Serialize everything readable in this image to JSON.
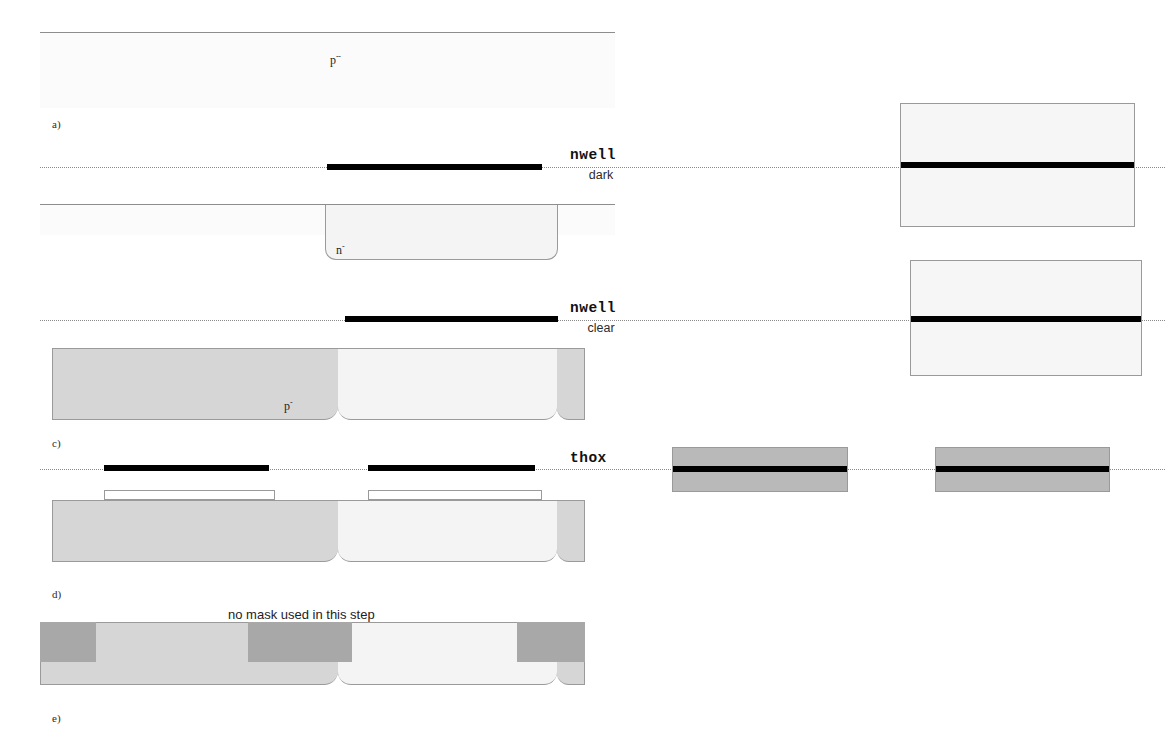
{
  "figure": {
    "type": "process-cross-section-diagram",
    "background_color": "#ffffff"
  },
  "steps": [
    {
      "id": "a",
      "label": "a)",
      "caption": "",
      "region_labels": [
        {
          "text": "p",
          "sup": "--"
        }
      ]
    },
    {
      "id": "b",
      "label": "",
      "caption": "",
      "region_labels": [
        {
          "text": "n",
          "sup": "-"
        }
      ]
    },
    {
      "id": "c",
      "label": "c)",
      "caption": "",
      "region_labels": [
        {
          "text": "p",
          "sup": "-"
        }
      ]
    },
    {
      "id": "d",
      "label": "d)",
      "caption": "",
      "region_labels": []
    },
    {
      "id": "e",
      "label": "e)",
      "caption": "no mask used in this step",
      "region_labels": []
    }
  ],
  "masks": [
    {
      "name": "nwell",
      "tone": "dark",
      "bar_count": 1,
      "plate_fill": "#f6f6f6",
      "plate_count": 1
    },
    {
      "name": "nwell",
      "tone": "clear",
      "bar_count": 1,
      "plate_fill": "#f6f6f6",
      "plate_count": 1
    },
    {
      "name": "thox",
      "tone": "",
      "bar_count": 2,
      "plate_fill": "#b9b9b9",
      "plate_count": 2
    }
  ],
  "colors": {
    "substrate": "#fbfbfb",
    "p_minus": "#d6d6d6",
    "n_well": "#f4f4f4",
    "field_oxide": "#a8a8a8",
    "thox_plate": "#b9b9b9",
    "mask_bar": "#000000",
    "outline": "#9a9a9a",
    "dotted_line": "#8a8a8a"
  },
  "notes": {
    "step_e_note": "no mask used in this step"
  }
}
